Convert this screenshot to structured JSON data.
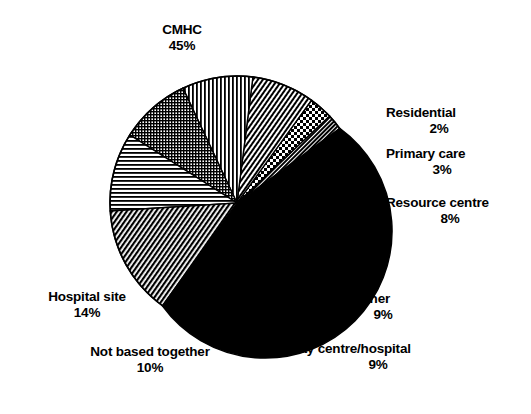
{
  "chart_data": {
    "type": "pie",
    "title": "",
    "subtitle": "",
    "xlabel": "",
    "ylabel": "",
    "legend_position": "none",
    "grid": false,
    "units": "percent",
    "total": 100,
    "categories": [
      "CMHC",
      "Residential",
      "Primary care",
      "Resource centre",
      "Other",
      "Day centre/hospital",
      "Not based together",
      "Hospital site"
    ],
    "values": [
      45,
      2,
      3,
      8,
      9,
      9,
      10,
      14
    ],
    "slices": [
      {
        "label": "CMHC",
        "value": 45,
        "value_text": "45%",
        "fill": "solid-black",
        "color": "#000000",
        "start_angle": -36,
        "end_angle": 126
      },
      {
        "label": "Residential",
        "value": 2,
        "value_text": "2%",
        "fill": "dense-diagonal",
        "color": "#3a3a3a",
        "start_angle": -43.2,
        "end_angle": -36
      },
      {
        "label": "Primary care",
        "value": 3,
        "value_text": "3%",
        "fill": "checkerboard",
        "color": "#888888",
        "start_angle": -54,
        "end_angle": -43.2
      },
      {
        "label": "Resource centre",
        "value": 8,
        "value_text": "8%",
        "fill": "diagonal-hatch",
        "color": "#707070",
        "start_angle": -82.8,
        "end_angle": -54
      },
      {
        "label": "Other",
        "value": 9,
        "value_text": "9%",
        "fill": "vertical-lines",
        "color": "#6a6a6a",
        "start_angle": -115.2,
        "end_angle": -82.8
      },
      {
        "label": "Day centre/hospital",
        "value": 9,
        "value_text": "9%",
        "fill": "fine-grid",
        "color": "#4f4f4f",
        "start_angle": -147.6,
        "end_angle": -115.2
      },
      {
        "label": "Not based together",
        "value": 10,
        "value_text": "10%",
        "fill": "horizontal-lines",
        "color": "#6a6a6a",
        "start_angle": -183.6,
        "end_angle": -147.6
      },
      {
        "label": "Hospital site",
        "value": 14,
        "value_text": "14%",
        "fill": "diagonal-hatch-wide",
        "color": "#5a5a5a",
        "start_angle": -234,
        "end_angle": -183.6
      }
    ],
    "outline_color": "#000000",
    "background": "#ffffff"
  },
  "labels": {
    "cmhc": {
      "name": "CMHC",
      "value": "45%"
    },
    "residential": {
      "name": "Residential",
      "value": "2%"
    },
    "primary_care": {
      "name": "Primary care",
      "value": "3%"
    },
    "resource_centre": {
      "name": "Resource centre",
      "value": "8%"
    },
    "other": {
      "name": "Other",
      "value": "9%"
    },
    "day_centre": {
      "name": "Day centre/hospital",
      "value": "9%"
    },
    "not_based": {
      "name": "Not based together",
      "value": "10%"
    },
    "hospital_site": {
      "name": "Hospital site",
      "value": "14%"
    }
  }
}
